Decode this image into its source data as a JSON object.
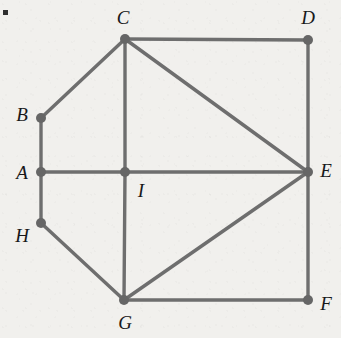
{
  "figure": {
    "background_color": "#f1f0ed",
    "edge_color": "#6e6e6e",
    "vertex_color": "#666666",
    "label_color": "#18181a",
    "corner_mark": {
      "x": 3,
      "y": 10,
      "size": 5,
      "color": "#2e2e2e"
    },
    "vertex_radius": 5,
    "edge_width": 3.4,
    "vertices": [
      {
        "id": "A",
        "label": "A",
        "x": 41,
        "y": 172,
        "label_x": 22,
        "label_y": 172
      },
      {
        "id": "B",
        "label": "B",
        "x": 41,
        "y": 118,
        "label_x": 22,
        "label_y": 114
      },
      {
        "id": "C",
        "label": "C",
        "x": 125,
        "y": 39,
        "label_x": 123,
        "label_y": 17
      },
      {
        "id": "D",
        "label": "D",
        "x": 308,
        "y": 40,
        "label_x": 308,
        "label_y": 17
      },
      {
        "id": "E",
        "label": "E",
        "x": 308,
        "y": 172,
        "label_x": 326,
        "label_y": 170
      },
      {
        "id": "F",
        "label": "F",
        "x": 308,
        "y": 300,
        "label_x": 326,
        "label_y": 303
      },
      {
        "id": "G",
        "label": "G",
        "x": 124,
        "y": 300,
        "label_x": 125,
        "label_y": 322
      },
      {
        "id": "H",
        "label": "H",
        "x": 41,
        "y": 223,
        "label_x": 22,
        "label_y": 235
      },
      {
        "id": "I",
        "label": "I",
        "x": 125,
        "y": 172,
        "label_x": 141,
        "label_y": 190
      }
    ],
    "edges": [
      {
        "from": "A",
        "to": "B"
      },
      {
        "from": "A",
        "to": "H"
      },
      {
        "from": "A",
        "to": "I"
      },
      {
        "from": "B",
        "to": "C"
      },
      {
        "from": "C",
        "to": "D"
      },
      {
        "from": "C",
        "to": "I"
      },
      {
        "from": "C",
        "to": "E"
      },
      {
        "from": "D",
        "to": "E"
      },
      {
        "from": "I",
        "to": "E"
      },
      {
        "from": "I",
        "to": "G"
      },
      {
        "from": "G",
        "to": "E"
      },
      {
        "from": "G",
        "to": "F"
      },
      {
        "from": "G",
        "to": "H"
      },
      {
        "from": "F",
        "to": "E"
      }
    ]
  }
}
